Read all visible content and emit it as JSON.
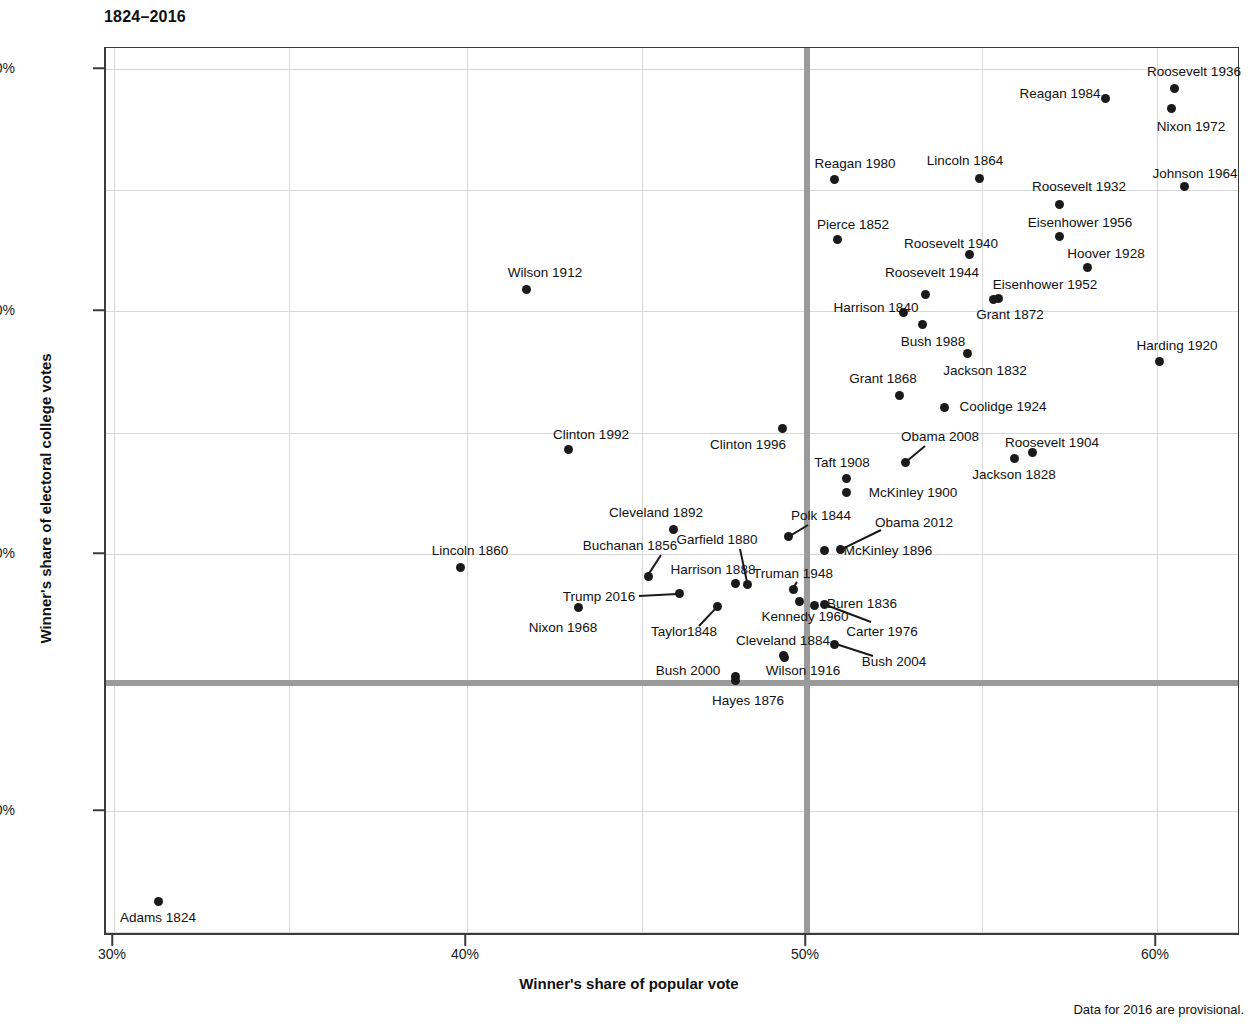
{
  "title": "1824–2016",
  "footnote": "Data for 2016 are provisional.",
  "axes": {
    "x_title": "Winner's share of popular vote",
    "y_title": "Winner's share of electoral college votes",
    "x_ticks": [
      {
        "label": "30%",
        "value": 30,
        "px": 112
      },
      {
        "label": "40%",
        "value": 40,
        "px": 465
      },
      {
        "label": "50%",
        "value": 50,
        "px": 805
      },
      {
        "label": "60%",
        "value": 60,
        "px": 1155
      }
    ],
    "y_ticks": [
      {
        "label": "100%",
        "value": 100,
        "px": 68
      },
      {
        "label": "80%",
        "value": 80,
        "px": 310
      },
      {
        "label": "60%",
        "value": 60,
        "px": 553
      },
      {
        "label": "40%",
        "value": 40,
        "px": 810
      }
    ],
    "gridlines_x_px": [
      287,
      640,
      980
    ],
    "gridlines_y_px": [
      189,
      432,
      682,
      931
    ],
    "reference_line_x_px": 805,
    "reference_line_y_px": 682,
    "reference_line_color": "#9a9a9a"
  },
  "chart_data": {
    "type": "scatter",
    "title": "1824–2016",
    "xlabel": "Winner's share of popular vote",
    "ylabel": "Winner's share of electoral college votes",
    "xlim": [
      29.0,
      62.0
    ],
    "ylim": [
      31.0,
      101.5
    ],
    "grid": true,
    "legend": null,
    "annotations": [
      "Horizontal reference line at 50% of electoral college votes",
      "Vertical reference line at 50% of popular vote"
    ],
    "point_color": "#1a1a1a",
    "points": [
      {
        "label": "Adams 1824",
        "x": 31.3,
        "y": 32.2,
        "px": 156,
        "py": 900,
        "lx": 156,
        "ly": 917,
        "anchor": "c"
      },
      {
        "label": "Jackson 1828",
        "x": 55.9,
        "y": 68.2,
        "px": 1012,
        "py": 457,
        "lx": 1012,
        "ly": 474,
        "anchor": "c"
      },
      {
        "label": "Jackson 1832",
        "x": 54.2,
        "y": 76.0,
        "px": 965,
        "py": 352,
        "lx": 983,
        "ly": 370,
        "anchor": "c"
      },
      {
        "label": "Buren 1836",
        "x": 50.8,
        "y": 57.8,
        "px": 812,
        "py": 604,
        "lx": 860,
        "ly": 603,
        "anchor": "c"
      },
      {
        "label": "Harrison 1840",
        "x": 52.9,
        "y": 79.6,
        "px": 901,
        "py": 311,
        "lx": 874,
        "ly": 307,
        "anchor": "c"
      },
      {
        "label": "Polk 1844",
        "x": 49.5,
        "y": 61.8,
        "px": 786,
        "py": 535,
        "lx": 819,
        "ly": 515,
        "anchor": "c"
      },
      {
        "label": "Taylor1848",
        "x": 47.3,
        "y": 56.2,
        "px": 715,
        "py": 605,
        "lx": 682,
        "ly": 631,
        "anchor": "c"
      },
      {
        "label": "Pierce 1852",
        "x": 50.8,
        "y": 85.8,
        "px": 835,
        "py": 238,
        "lx": 851,
        "ly": 224,
        "anchor": "c"
      },
      {
        "label": "Buchanan 1856",
        "x": 45.3,
        "y": 58.8,
        "px": 646,
        "py": 575,
        "lx": 628,
        "ly": 545,
        "anchor": "c"
      },
      {
        "label": "Lincoln 1860",
        "x": 39.8,
        "y": 59.4,
        "px": 458,
        "py": 566,
        "lx": 468,
        "ly": 550,
        "anchor": "c"
      },
      {
        "label": "Lincoln 1864",
        "x": 55.0,
        "y": 90.9,
        "px": 977,
        "py": 177,
        "lx": 963,
        "ly": 160,
        "anchor": "c"
      },
      {
        "label": "Grant 1868",
        "x": 52.7,
        "y": 72.8,
        "px": 897,
        "py": 394,
        "lx": 881,
        "ly": 378,
        "anchor": "c"
      },
      {
        "label": "Grant 1872",
        "x": 55.6,
        "y": 81.3,
        "px": 996,
        "py": 297,
        "lx": 1008,
        "ly": 314,
        "anchor": "c"
      },
      {
        "label": "Hayes 1876",
        "x": 47.9,
        "y": 50.1,
        "px": 733,
        "py": 679,
        "lx": 746,
        "ly": 700,
        "anchor": "c"
      },
      {
        "label": "Garfield 1880",
        "x": 48.3,
        "y": 58.0,
        "px": 745,
        "py": 583,
        "lx": 715,
        "ly": 539,
        "anchor": "c"
      },
      {
        "label": "Cleveland 1884",
        "x": 48.9,
        "y": 54.6,
        "px": 781,
        "py": 654,
        "lx": 781,
        "ly": 640,
        "anchor": "c"
      },
      {
        "label": "Harrison 1888",
        "x": 47.8,
        "y": 58.1,
        "px": 733,
        "py": 582,
        "lx": 711,
        "ly": 569,
        "anchor": "c"
      },
      {
        "label": "Cleveland 1892",
        "x": 46.0,
        "y": 62.4,
        "px": 671,
        "py": 528,
        "lx": 654,
        "ly": 512,
        "anchor": "c"
      },
      {
        "label": "McKinley 1896",
        "x": 51.0,
        "y": 60.6,
        "px": 822,
        "py": 549,
        "lx": 886,
        "ly": 550,
        "anchor": "c"
      },
      {
        "label": "McKinley 1900",
        "x": 51.6,
        "y": 65.3,
        "px": 844,
        "py": 491,
        "lx": 911,
        "ly": 492,
        "anchor": "c"
      },
      {
        "label": "Roosevelt 1904",
        "x": 56.4,
        "y": 70.6,
        "px": 1030,
        "py": 451,
        "lx": 1050,
        "ly": 442,
        "anchor": "c"
      },
      {
        "label": "Taft 1908",
        "x": 51.6,
        "y": 66.5,
        "px": 844,
        "py": 477,
        "lx": 840,
        "ly": 462,
        "anchor": "c"
      },
      {
        "label": "Wilson 1912",
        "x": 41.8,
        "y": 81.9,
        "px": 524,
        "py": 288,
        "lx": 543,
        "ly": 272,
        "anchor": "c"
      },
      {
        "label": "Wilson 1916",
        "x": 49.2,
        "y": 52.2,
        "px": 782,
        "py": 656,
        "lx": 801,
        "ly": 670,
        "anchor": "c"
      },
      {
        "label": "Harding 1920",
        "x": 60.3,
        "y": 76.1,
        "px": 1157,
        "py": 360,
        "lx": 1175,
        "ly": 345,
        "anchor": "c"
      },
      {
        "label": "Coolidge 1924",
        "x": 54.0,
        "y": 71.9,
        "px": 942,
        "py": 406,
        "lx": 1001,
        "ly": 406,
        "anchor": "c"
      },
      {
        "label": "Hoover 1928",
        "x": 58.2,
        "y": 83.6,
        "px": 1085,
        "py": 266,
        "lx": 1104,
        "ly": 253,
        "anchor": "c"
      },
      {
        "label": "Roosevelt 1932",
        "x": 57.4,
        "y": 88.9,
        "px": 1057,
        "py": 203,
        "lx": 1077,
        "ly": 186,
        "anchor": "c"
      },
      {
        "label": "Roosevelt 1936",
        "x": 60.8,
        "y": 98.5,
        "px": 1172,
        "py": 87,
        "lx": 1192,
        "ly": 71,
        "anchor": "c"
      },
      {
        "label": "Roosevelt 1940",
        "x": 54.7,
        "y": 84.6,
        "px": 967,
        "py": 253,
        "lx": 949,
        "ly": 243,
        "anchor": "c"
      },
      {
        "label": "Roosevelt 1944",
        "x": 53.4,
        "y": 81.4,
        "px": 923,
        "py": 293,
        "lx": 930,
        "ly": 272,
        "anchor": "c"
      },
      {
        "label": "Truman 1948",
        "x": 49.6,
        "y": 57.1,
        "px": 791,
        "py": 588,
        "lx": 791,
        "ly": 573,
        "anchor": "c"
      },
      {
        "label": "Eisenhower 1952",
        "x": 55.2,
        "y": 83.2,
        "px": 991,
        "py": 298,
        "lx": 1043,
        "ly": 284,
        "anchor": "c"
      },
      {
        "label": "Eisenhower 1956",
        "x": 57.4,
        "y": 86.1,
        "px": 1057,
        "py": 235,
        "lx": 1078,
        "ly": 222,
        "anchor": "c"
      },
      {
        "label": "Nixon 1968",
        "x": 43.4,
        "y": 55.9,
        "px": 576,
        "py": 606,
        "lx": 561,
        "ly": 627,
        "anchor": "c"
      },
      {
        "label": "Nixon 1972",
        "x": 60.7,
        "y": 96.7,
        "px": 1169,
        "py": 107,
        "lx": 1189,
        "ly": 126,
        "anchor": "c"
      },
      {
        "label": "Johnson 1964",
        "x": 61.1,
        "y": 90.3,
        "px": 1182,
        "py": 185,
        "lx": 1193,
        "ly": 173,
        "anchor": "c"
      },
      {
        "label": "Kennedy 1960",
        "x": 49.7,
        "y": 56.4,
        "px": 797,
        "py": 600,
        "lx": 803,
        "ly": 616,
        "anchor": "c"
      },
      {
        "label": "Carter 1976",
        "x": 50.1,
        "y": 55.2,
        "px": 822,
        "py": 603,
        "lx": 880,
        "ly": 631,
        "anchor": "c"
      },
      {
        "label": "Reagan 1980",
        "x": 50.7,
        "y": 90.9,
        "px": 832,
        "py": 178,
        "lx": 853,
        "ly": 163,
        "anchor": "c"
      },
      {
        "label": "Reagan 1984",
        "x": 58.8,
        "y": 97.6,
        "px": 1103,
        "py": 97,
        "lx": 1058,
        "ly": 93,
        "anchor": "c"
      },
      {
        "label": "Bush 1988",
        "x": 53.4,
        "y": 79.2,
        "px": 920,
        "py": 323,
        "lx": 931,
        "ly": 341,
        "anchor": "c"
      },
      {
        "label": "Clinton 1992",
        "x": 43.0,
        "y": 68.8,
        "px": 566,
        "py": 448,
        "lx": 589,
        "ly": 434,
        "anchor": "c"
      },
      {
        "label": "Clinton 1996",
        "x": 49.2,
        "y": 70.4,
        "px": 780,
        "py": 427,
        "lx": 746,
        "ly": 444,
        "anchor": "c"
      },
      {
        "label": "Bush 2000",
        "x": 47.9,
        "y": 50.4,
        "px": 733,
        "py": 675,
        "lx": 686,
        "ly": 670,
        "anchor": "c"
      },
      {
        "label": "Bush 2004",
        "x": 50.7,
        "y": 53.2,
        "px": 832,
        "py": 643,
        "lx": 892,
        "ly": 661,
        "anchor": "c"
      },
      {
        "label": "Obama 2008",
        "x": 52.9,
        "y": 67.8,
        "px": 903,
        "py": 461,
        "lx": 938,
        "ly": 436,
        "anchor": "c"
      },
      {
        "label": "Obama 2012",
        "x": 51.1,
        "y": 61.7,
        "px": 838,
        "py": 548,
        "lx": 912,
        "ly": 522,
        "anchor": "c"
      },
      {
        "label": "Trump 2016",
        "x": 46.1,
        "y": 56.9,
        "px": 677,
        "py": 592,
        "lx": 597,
        "ly": 596,
        "anchor": "c"
      }
    ],
    "leaders": [
      {
        "label": "Buchanan 1856",
        "x1": 659,
        "y1": 553,
        "x2": 646,
        "y2": 573
      },
      {
        "label": "Trump 2016",
        "x1": 637,
        "y1": 594,
        "x2": 675,
        "y2": 592
      },
      {
        "label": "Taylor1848",
        "x1": 697,
        "y1": 624,
        "x2": 715,
        "y2": 605
      },
      {
        "label": "Garfield 1880",
        "x1": 738,
        "y1": 547,
        "x2": 745,
        "y2": 580
      },
      {
        "label": "Polk 1844",
        "x1": 806,
        "y1": 523,
        "x2": 788,
        "y2": 534
      },
      {
        "label": "Truman 1948",
        "x1": 795,
        "y1": 580,
        "x2": 791,
        "y2": 586
      },
      {
        "label": "Obama 2008",
        "x1": 923,
        "y1": 444,
        "x2": 905,
        "y2": 459
      },
      {
        "label": "Obama 2012",
        "x1": 879,
        "y1": 528,
        "x2": 840,
        "y2": 547
      },
      {
        "label": "Carter 1976",
        "x1": 869,
        "y1": 620,
        "x2": 824,
        "y2": 603
      },
      {
        "label": "Bush 2004",
        "x1": 871,
        "y1": 654,
        "x2": 834,
        "y2": 642
      }
    ]
  }
}
